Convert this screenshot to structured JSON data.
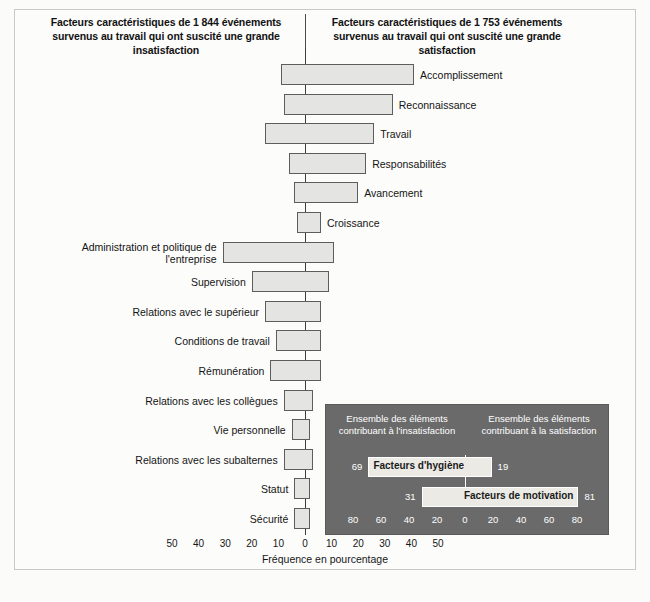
{
  "figure": {
    "caption_top": "",
    "source_note": ""
  },
  "headers": {
    "left": "Facteurs caractéristiques de 1 844 événements survenus au travail qui ont suscité une grande insatisfaction",
    "right": "Facteurs caractéristiques de 1 753 événements survenus au travail qui ont suscité une grande satisfaction"
  },
  "axis": {
    "title": "Fréquence en pourcentage",
    "ticks": [
      "50",
      "40",
      "30",
      "20",
      "10",
      "0",
      "10",
      "20",
      "30",
      "40",
      "50"
    ]
  },
  "inset": {
    "header_left": "Ensemble des éléments contribuant à l'insatisfaction",
    "header_right": "Ensemble des éléments contribuant à la satisfaction",
    "rows": [
      {
        "label": "Facteurs d'hygiène",
        "left_value": "69",
        "right_value": "19"
      },
      {
        "label": "Facteurs de motivation",
        "left_value": "31",
        "right_value": "81"
      }
    ],
    "ticks": [
      "80",
      "60",
      "40",
      "20",
      "0",
      "20",
      "40",
      "60",
      "80"
    ]
  },
  "chart_data": {
    "type": "bar",
    "xlabel": "Fréquence en pourcentage",
    "ylabel": "",
    "xlim": [
      -50,
      50
    ],
    "grid": false,
    "legend": "none",
    "categories": [
      "Accomplissement",
      "Reconnaissance",
      "Travail",
      "Responsabilités",
      "Avancement",
      "Croissance",
      "Administration et politique de l'entreprise",
      "Supervision",
      "Relations avec le supérieur",
      "Conditions de travail",
      "Rémunération",
      "Relations avec les collègues",
      "Vie personnelle",
      "Relations avec les subalternes",
      "Statut",
      "Sécurité"
    ],
    "series": [
      {
        "name": "Insatisfaction (gauche)",
        "values": [
          9,
          8,
          15,
          6,
          4,
          3,
          31,
          20,
          15,
          11,
          13,
          8,
          5,
          8,
          4,
          4
        ]
      },
      {
        "name": "Satisfaction (droite)",
        "values": [
          41,
          33,
          26,
          23,
          20,
          6,
          11,
          9,
          6,
          6,
          6,
          3,
          2,
          3,
          2,
          2
        ]
      }
    ],
    "bars": [
      {
        "category": "Accomplissement",
        "left": 9,
        "right": 41,
        "label_side": "right"
      },
      {
        "category": "Reconnaissance",
        "left": 8,
        "right": 33,
        "label_side": "right"
      },
      {
        "category": "Travail",
        "left": 15,
        "right": 26,
        "label_side": "right"
      },
      {
        "category": "Responsabilités",
        "left": 6,
        "right": 23,
        "label_side": "right"
      },
      {
        "category": "Avancement",
        "left": 4,
        "right": 20,
        "label_side": "right"
      },
      {
        "category": "Croissance",
        "left": 3,
        "right": 6,
        "label_side": "right"
      },
      {
        "category": "Administration et politique de l'entreprise",
        "left": 31,
        "right": 11,
        "label_side": "left"
      },
      {
        "category": "Supervision",
        "left": 20,
        "right": 9,
        "label_side": "left"
      },
      {
        "category": "Relations avec le supérieur",
        "left": 15,
        "right": 6,
        "label_side": "left"
      },
      {
        "category": "Conditions de travail",
        "left": 11,
        "right": 6,
        "label_side": "left"
      },
      {
        "category": "Rémunération",
        "left": 13,
        "right": 6,
        "label_side": "left"
      },
      {
        "category": "Relations avec les collègues",
        "left": 8,
        "right": 3,
        "label_side": "left"
      },
      {
        "category": "Vie personnelle",
        "left": 5,
        "right": 2,
        "label_side": "left"
      },
      {
        "category": "Relations avec les subalternes",
        "left": 8,
        "right": 3,
        "label_side": "left"
      },
      {
        "category": "Statut",
        "left": 4,
        "right": 2,
        "label_side": "left"
      },
      {
        "category": "Sécurité",
        "left": 4,
        "right": 2,
        "label_side": "left"
      }
    ],
    "inset_chart": {
      "type": "bar",
      "xlim": [
        -90,
        90
      ],
      "categories": [
        "Facteurs d'hygiène",
        "Facteurs de motivation"
      ],
      "series": [
        {
          "name": "Contribuant à l'insatisfaction",
          "values": [
            69,
            31
          ]
        },
        {
          "name": "Contribuant à la satisfaction",
          "values": [
            19,
            81
          ]
        }
      ]
    }
  }
}
